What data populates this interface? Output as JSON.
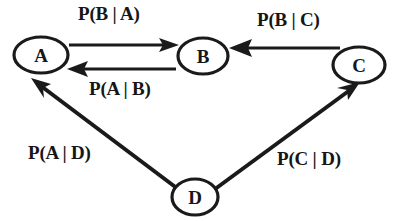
{
  "diagram": {
    "type": "directed-graph",
    "title": "",
    "background_color": "#ffffff",
    "stroke_color": "#1a1a1a",
    "text_color": "#161616",
    "nodes": [
      {
        "id": "A",
        "label": "A",
        "cx": 41,
        "cy": 55,
        "rx": 27,
        "ry": 18
      },
      {
        "id": "B",
        "label": "B",
        "cx": 203,
        "cy": 56,
        "rx": 25,
        "ry": 18
      },
      {
        "id": "C",
        "label": "C",
        "cx": 359,
        "cy": 65,
        "rx": 26,
        "ry": 18
      },
      {
        "id": "D",
        "label": "D",
        "cx": 195,
        "cy": 197,
        "rx": 23,
        "ry": 18
      }
    ],
    "edges": [
      {
        "from": "A",
        "to": "B",
        "label": "P(B | A)",
        "label_x": 78,
        "label_y": 4
      },
      {
        "from": "B",
        "to": "A",
        "label": "P(A | B)",
        "label_x": 89,
        "label_y": 79
      },
      {
        "from": "C",
        "to": "B",
        "label": "P(B | C)",
        "label_x": 257,
        "label_y": 10
      },
      {
        "from": "D",
        "to": "A",
        "label": "P(A | D)",
        "label_x": 28,
        "label_y": 143
      },
      {
        "from": "D",
        "to": "C",
        "label": "P(C | D)",
        "label_x": 277,
        "label_y": 149
      }
    ]
  }
}
